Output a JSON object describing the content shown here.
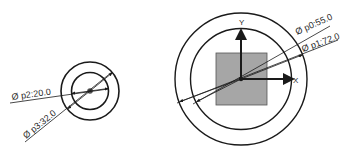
{
  "diagram": {
    "type": "cad-sketch-dimensions",
    "left_part": {
      "outer_circle_dimension": "Ø p3:32.0",
      "inner_circle_dimension": "Ø p2:20.0"
    },
    "right_part": {
      "inner_circle_dimension": "Ø p0:55.0",
      "outer_circle_dimension": "Ø p1:72.0",
      "axes": {
        "x_label": "X",
        "y_label": "Y"
      }
    },
    "colors": {
      "line": "#1a1a1a",
      "square_fill": "#a6a6a6",
      "background": "#ffffff"
    }
  }
}
